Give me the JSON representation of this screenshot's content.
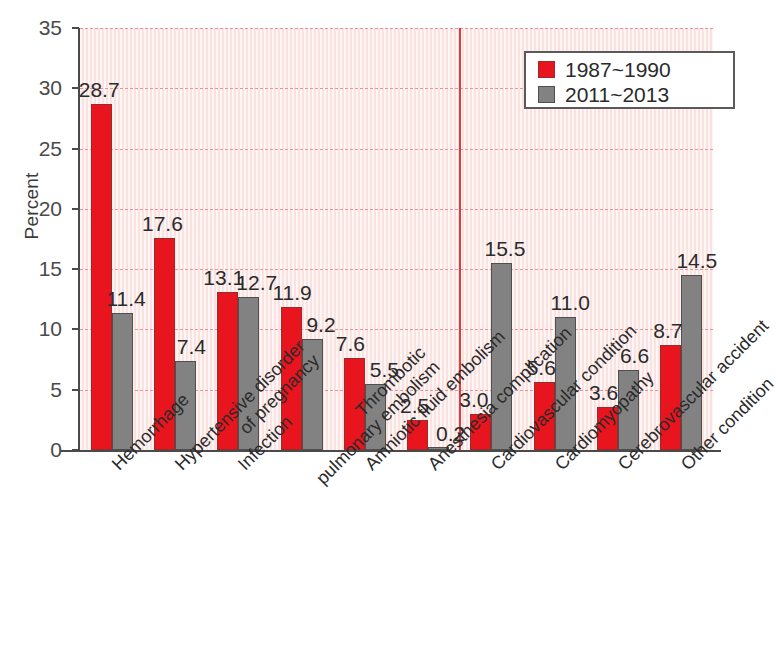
{
  "chart_data": {
    "type": "bar",
    "title": "",
    "xlabel": "",
    "ylabel": "Percent",
    "ylim": [
      0,
      35
    ],
    "yticks": [
      0,
      5,
      10,
      15,
      20,
      25,
      30,
      35
    ],
    "grid": true,
    "legend_position": "top-right",
    "categories": [
      "Hemorrhage",
      "Hypertensive disorder\nof pregnancy",
      "Infection",
      "Thrombotic\npulmonary embolism",
      "Amniotic fluid embolism",
      "Anesthesia complication",
      "Cardiovascular condition",
      "Cardiomyopathy",
      "Cerebrovascular accident",
      "Other condition"
    ],
    "series": [
      {
        "name": "1987~1990",
        "color": "#e8141e",
        "values": [
          28.7,
          17.6,
          13.1,
          11.9,
          7.6,
          2.5,
          3.0,
          5.6,
          3.6,
          8.7
        ]
      },
      {
        "name": "2011~2013",
        "color": "#828282",
        "values": [
          11.4,
          7.4,
          12.7,
          9.2,
          5.5,
          0.2,
          15.5,
          11.0,
          6.6,
          14.5
        ]
      }
    ],
    "annotations": [
      {
        "name": "category-divider",
        "type": "vertical-line",
        "color": "#e23b3b",
        "after_category_index": 5
      }
    ]
  }
}
